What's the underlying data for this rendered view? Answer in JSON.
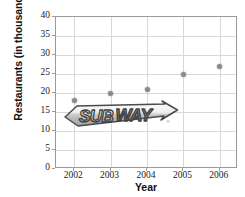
{
  "chart_data": {
    "type": "scatter",
    "title": "",
    "xlabel": "Year",
    "ylabel": "Restaurants (in thousands)",
    "categories": [
      "2002",
      "2003",
      "2004",
      "2005",
      "2006"
    ],
    "x": [
      2002,
      2003,
      2004,
      2005,
      2006
    ],
    "values": [
      18,
      20,
      21,
      25,
      27
    ],
    "series": [
      {
        "name": "Restaurants",
        "values": [
          18,
          20,
          21,
          25,
          27
        ]
      }
    ],
    "ylim": [
      0,
      40
    ],
    "ytick_step": 5,
    "yticks": [
      "40",
      "35",
      "30",
      "25",
      "20",
      "15",
      "10",
      "5",
      "0"
    ],
    "xticks": [
      "2002",
      "2003",
      "2004",
      "2005",
      "2006"
    ],
    "grid": true,
    "legend": false,
    "legend_position": "none",
    "marker_color": "#8a8a8a",
    "grid_color": "#d8d8d8",
    "axis_color": "#9a9a9a",
    "annotations": [
      {
        "name": "subway-watermark",
        "text": "SUBWAY",
        "registered_mark": "®"
      }
    ]
  },
  "axes": {
    "y_title": "Restaurants (in thousands)",
    "x_title": "Year"
  },
  "watermark": {
    "brand": "SUBWAY",
    "registered": "®"
  }
}
